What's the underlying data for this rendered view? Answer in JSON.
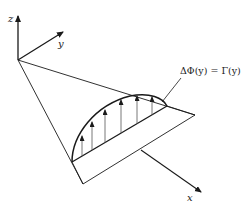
{
  "diagram": {
    "axes": {
      "z_label": "z",
      "y_label": "y",
      "x_label": "x"
    },
    "equation_label": "ΔΦ(y) = Γ(y)",
    "colors": {
      "line": "#1a1a1a",
      "background": "#ffffff"
    },
    "arrow_count": 6
  }
}
